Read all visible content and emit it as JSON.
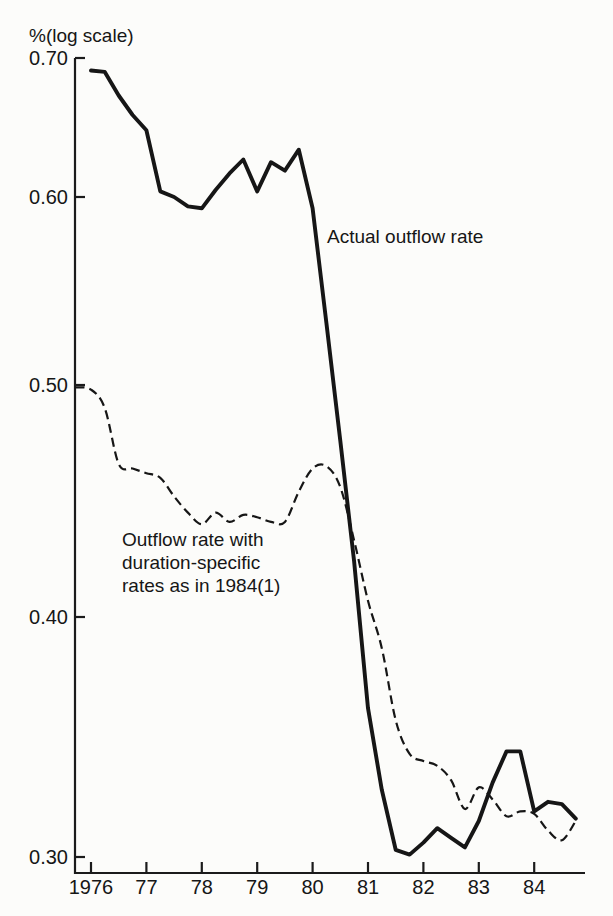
{
  "figure": {
    "background_color": "#fcfcfa",
    "line_color": "#161616",
    "axis_color": "#1b1b1b"
  },
  "annotations": {
    "solid_label": "Actual outflow rate",
    "dashed_label_lines": [
      "Outflow rate with",
      "duration-specific",
      "rates as in 1984(1)"
    ]
  },
  "chart_data": {
    "type": "line",
    "title": "",
    "xlabel": "",
    "ylabel": "%(log scale)",
    "grid": false,
    "legend_position": "inline-annotations",
    "y_axis": {
      "scale": "log",
      "range": [
        0.3,
        0.7
      ],
      "tick_values": [
        0.7,
        0.6,
        0.5,
        0.4,
        0.3
      ],
      "tick_labels": [
        "0.70",
        "0.60",
        "0.50",
        "0.40",
        "0.30"
      ]
    },
    "x_axis": {
      "range": [
        1975.7,
        1984.92
      ],
      "tick_values": [
        1976,
        1977,
        1978,
        1979,
        1980,
        1981,
        1982,
        1983,
        1984
      ],
      "tick_labels": [
        "1976",
        "77",
        "78",
        "79",
        "80",
        "81",
        "82",
        "83",
        "84"
      ]
    },
    "series": [
      {
        "name": "Actual outflow rate",
        "line_style": "solid",
        "x": [
          1976.0,
          1976.25,
          1976.5,
          1976.75,
          1977.0,
          1977.25,
          1977.5,
          1977.75,
          1978.0,
          1978.25,
          1978.5,
          1978.75,
          1979.0,
          1979.25,
          1979.5,
          1979.75,
          1980.0,
          1980.25,
          1980.5,
          1980.75,
          1981.0,
          1981.25,
          1981.5,
          1981.75,
          1982.0,
          1982.25,
          1982.5,
          1982.75,
          1983.0,
          1983.25,
          1983.5,
          1983.75,
          1984.0,
          1984.25,
          1984.5,
          1984.75
        ],
        "y": [
          0.691,
          0.69,
          0.673,
          0.659,
          0.648,
          0.604,
          0.6,
          0.595,
          0.594,
          0.605,
          0.617,
          0.627,
          0.604,
          0.625,
          0.619,
          0.634,
          0.594,
          0.533,
          0.476,
          0.424,
          0.362,
          0.328,
          0.303,
          0.301,
          0.306,
          0.312,
          0.308,
          0.304,
          0.315,
          0.331,
          0.344,
          0.344,
          0.319,
          0.323,
          0.322,
          0.316
        ]
      },
      {
        "name": "Outflow rate with duration-specific rates as in 1984(1)",
        "line_style": "dashed",
        "x": [
          1975.72,
          1976.0,
          1976.25,
          1976.5,
          1976.75,
          1977.0,
          1977.25,
          1977.5,
          1977.75,
          1978.0,
          1978.25,
          1978.5,
          1978.75,
          1979.0,
          1979.25,
          1979.5,
          1979.75,
          1980.0,
          1980.25,
          1980.5,
          1980.75,
          1981.0,
          1981.25,
          1981.5,
          1981.75,
          1982.0,
          1982.25,
          1982.5,
          1982.75,
          1983.0,
          1983.25,
          1983.5,
          1983.75,
          1984.0,
          1984.25,
          1984.5,
          1984.75
        ],
        "y": [
          0.499,
          0.498,
          0.49,
          0.466,
          0.464,
          0.462,
          0.46,
          0.452,
          0.445,
          0.44,
          0.445,
          0.441,
          0.444,
          0.443,
          0.441,
          0.441,
          0.454,
          0.464,
          0.465,
          0.456,
          0.433,
          0.407,
          0.387,
          0.357,
          0.343,
          0.34,
          0.338,
          0.332,
          0.32,
          0.329,
          0.324,
          0.317,
          0.319,
          0.318,
          0.311,
          0.307,
          0.315
        ]
      }
    ]
  }
}
